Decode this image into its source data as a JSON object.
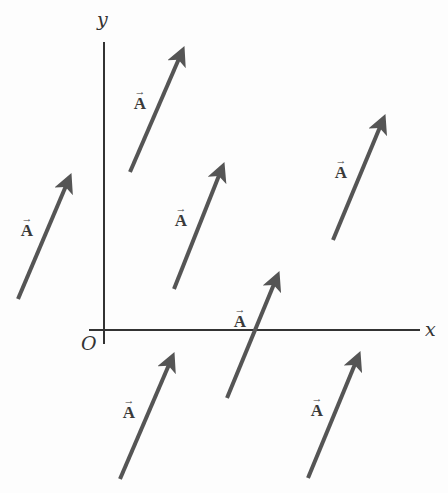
{
  "figure": {
    "width": 448,
    "height": 493
  },
  "colors": {
    "axis": "#333333",
    "vector": "#555555",
    "label": "#3a3a3a",
    "background": "#fdfdfd"
  },
  "axes": {
    "x_label": "x",
    "y_label": "y",
    "origin_label": "O",
    "origin": [
      104,
      330
    ],
    "x_axis": {
      "x1": 89,
      "x2": 420,
      "y": 330
    },
    "y_axis": {
      "x": 104,
      "y1": 42,
      "y2": 344
    }
  },
  "vector_symbol": "A",
  "vector_arrow_glyph": "→",
  "vectors": [
    {
      "id": 1,
      "label": "A",
      "tail": [
        130,
        172
      ],
      "head": [
        184,
        47
      ],
      "label_pos": [
        132,
        88
      ]
    },
    {
      "id": 2,
      "label": "A",
      "tail": [
        18,
        299
      ],
      "head": [
        71,
        174
      ],
      "label_pos": [
        19,
        215
      ]
    },
    {
      "id": 3,
      "label": "A",
      "tail": [
        174,
        289
      ],
      "head": [
        224,
        163
      ],
      "label_pos": [
        173,
        205
      ]
    },
    {
      "id": 4,
      "label": "A",
      "tail": [
        333,
        240
      ],
      "head": [
        385,
        115
      ],
      "label_pos": [
        333,
        157
      ]
    },
    {
      "id": 5,
      "label": "A",
      "tail": [
        227,
        398
      ],
      "head": [
        279,
        272
      ],
      "label_pos": [
        232,
        306
      ]
    },
    {
      "id": 6,
      "label": "A",
      "tail": [
        120,
        479
      ],
      "head": [
        174,
        353
      ],
      "label_pos": [
        121,
        397
      ]
    },
    {
      "id": 7,
      "label": "A",
      "tail": [
        308,
        478
      ],
      "head": [
        360,
        352
      ],
      "label_pos": [
        309,
        395
      ]
    }
  ]
}
